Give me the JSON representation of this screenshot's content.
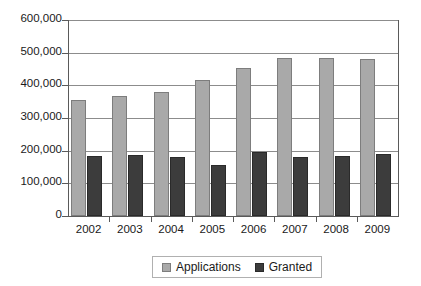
{
  "chart_data": {
    "type": "bar",
    "title": "",
    "subtitle": "",
    "xlabel": "",
    "ylabel": "",
    "categories": [
      "2002",
      "2003",
      "2004",
      "2005",
      "2006",
      "2007",
      "2008",
      "2009"
    ],
    "series": [
      {
        "name": "Applications",
        "color": "#a9a9a9",
        "values": [
          355000,
          366000,
          380000,
          417000,
          453000,
          484000,
          484000,
          482000
        ]
      },
      {
        "name": "Granted",
        "color": "#3c3c3c",
        "values": [
          184000,
          188000,
          180000,
          157000,
          196000,
          182000,
          185000,
          191000
        ]
      }
    ],
    "ylim": [
      0,
      600000
    ],
    "ytick_values": [
      0,
      100000,
      200000,
      300000,
      400000,
      500000,
      600000
    ],
    "ytick_labels": [
      "0",
      "100,000",
      "200,000",
      "300,000",
      "400,000",
      "500,000",
      "600,000"
    ],
    "grid": true,
    "grid_axis": "y",
    "legend_position": "bottom",
    "legend_entries": [
      "Applications",
      "Granted"
    ]
  },
  "colors": {
    "applications": "#a9a9a9",
    "granted": "#3c3c3c",
    "gridline": "#8c8c8c",
    "axis": "#5a5a5a",
    "text": "#1a1a1a",
    "background": "#ffffff"
  }
}
